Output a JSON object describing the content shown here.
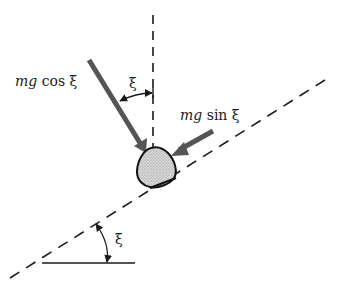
{
  "diagram": {
    "labels": {
      "normal_force": {
        "italic": "mg",
        "rest": " cos ξ"
      },
      "tangential_force": {
        "italic": "mg",
        "rest": " sin ξ"
      },
      "top_angle": "ξ",
      "incline_angle": "ξ"
    },
    "colors": {
      "arrow": "#555555",
      "line": "#1a1a1a",
      "block_fill": "#cccccc",
      "block_stroke": "#111111"
    },
    "elements": [
      "vertical dashed reference line",
      "inclined dashed plane",
      "horizontal reference line",
      "block (stippled)",
      "arrow mg cos ξ (perpendicular to plane)",
      "arrow mg sin ξ (along plane)",
      "angle arc ξ between vertical and normal",
      "angle arc ξ between horizontal and incline"
    ]
  }
}
